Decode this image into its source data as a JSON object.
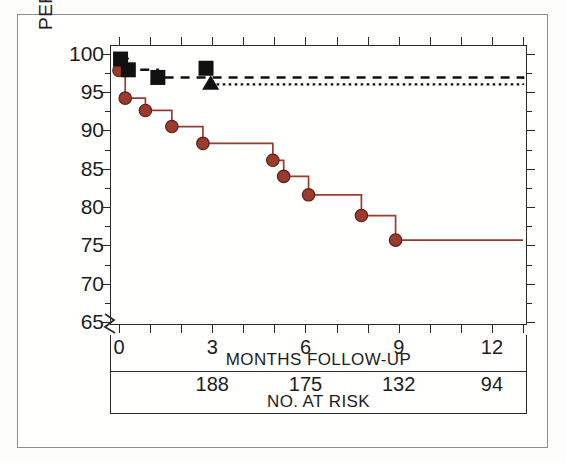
{
  "chart_data": {
    "type": "line",
    "title": "",
    "xlabel": "MONTHS FOLLOW-UP",
    "ylabel": "PERCENT SURVIVAL",
    "xlim": [
      0,
      13
    ],
    "ylim": [
      64.5,
      101
    ],
    "y_axis_break": true,
    "grid": false,
    "legend_position": "none",
    "x_ticks": [
      0,
      1,
      2,
      3,
      4,
      5,
      6,
      7,
      8,
      9,
      10,
      11,
      12,
      13
    ],
    "x_tick_labels": [
      "0",
      "",
      "",
      "3",
      "",
      "",
      "6",
      "",
      "",
      "9",
      "",
      "",
      "12",
      ""
    ],
    "x_major_labels": [
      {
        "value": 0,
        "label": "0"
      },
      {
        "value": 3,
        "label": "3"
      },
      {
        "value": 6,
        "label": "6"
      },
      {
        "value": 9,
        "label": "9"
      },
      {
        "value": 12,
        "label": "12"
      }
    ],
    "y_ticks": [
      65,
      70,
      75,
      80,
      85,
      90,
      95,
      100
    ],
    "y_tick_labels": [
      "65",
      "70",
      "75",
      "80",
      "85",
      "90",
      "95",
      "100"
    ],
    "y_minor_ticks": [
      67.5,
      72.5,
      77.5,
      82.5,
      87.5,
      92.5,
      97.5
    ],
    "series": [
      {
        "name": "solid-circle-curve",
        "style": "solid",
        "color": "#9a3b2e",
        "marker": "circle",
        "points": [
          {
            "x": 0.0,
            "y": 97.8
          },
          {
            "x": 0.2,
            "y": 94.2
          },
          {
            "x": 0.85,
            "y": 92.6
          },
          {
            "x": 1.7,
            "y": 90.5
          },
          {
            "x": 2.7,
            "y": 88.3
          },
          {
            "x": 4.95,
            "y": 86.1
          },
          {
            "x": 5.3,
            "y": 84.0
          },
          {
            "x": 6.1,
            "y": 81.6
          },
          {
            "x": 7.8,
            "y": 78.9
          },
          {
            "x": 8.9,
            "y": 75.7
          },
          {
            "x": 13.0,
            "y": 75.7
          }
        ]
      },
      {
        "name": "dashed-square-curve",
        "style": "dashed",
        "color": "#111111",
        "marker": "square",
        "points": [
          {
            "x": 0.0,
            "y": 99.3
          },
          {
            "x": 0.28,
            "y": 97.9
          },
          {
            "x": 1.25,
            "y": 96.9
          },
          {
            "x": 2.75,
            "y": 96.9
          },
          {
            "x": 13.0,
            "y": 96.7
          }
        ],
        "markers": [
          {
            "x": 0.05,
            "y": 99.3
          },
          {
            "x": 0.3,
            "y": 97.9
          },
          {
            "x": 1.25,
            "y": 96.9
          },
          {
            "x": 2.8,
            "y": 98.1
          }
        ]
      },
      {
        "name": "dotted-triangle-curve",
        "style": "dotted",
        "color": "#111111",
        "marker": "triangle",
        "points": [
          {
            "x": 2.95,
            "y": 96.0
          },
          {
            "x": 13.0,
            "y": 95.9
          }
        ],
        "markers": [
          {
            "x": 2.95,
            "y": 96.0
          }
        ]
      }
    ],
    "at_risk": {
      "caption": "NO. AT RISK",
      "entries": [
        {
          "x": 3,
          "count": "188"
        },
        {
          "x": 6,
          "count": "175"
        },
        {
          "x": 9,
          "count": "132"
        },
        {
          "x": 12,
          "count": "94"
        }
      ]
    },
    "colors": {
      "curve_red": "#9a3b2e",
      "axis": "#2b2b2b",
      "text": "#1d1d1d",
      "background": "#fdfdfc"
    }
  }
}
